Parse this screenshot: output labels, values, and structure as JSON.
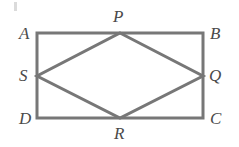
{
  "figure": {
    "stroke_color": "#777777",
    "label_color": "#4a4a4a",
    "background_color": "#ffffff",
    "stroke_width": 3,
    "rectangle": {
      "name": "ABCD",
      "left": 37,
      "top": 33,
      "right": 203,
      "bottom": 118,
      "width": 166,
      "height": 85
    },
    "rhombus": {
      "name": "PQRS",
      "vertices": [
        {
          "label": "P",
          "x": 120,
          "y": 33,
          "on": "AB"
        },
        {
          "label": "Q",
          "x": 203,
          "y": 76,
          "on": "BC"
        },
        {
          "label": "R",
          "x": 120,
          "y": 118,
          "on": "DC"
        },
        {
          "label": "S",
          "x": 37,
          "y": 76,
          "on": "AD"
        }
      ]
    },
    "labels": [
      {
        "name": "label-A",
        "text": "A",
        "x": 19,
        "y": 25
      },
      {
        "name": "label-B",
        "text": "B",
        "x": 210,
        "y": 25
      },
      {
        "name": "label-C",
        "text": "C",
        "x": 210,
        "y": 110
      },
      {
        "name": "label-D",
        "text": "D",
        "x": 19,
        "y": 110
      },
      {
        "name": "label-P",
        "text": "P",
        "x": 113,
        "y": 8
      },
      {
        "name": "label-Q",
        "text": "Q",
        "x": 209,
        "y": 67
      },
      {
        "name": "label-S",
        "text": "S",
        "x": 19,
        "y": 67
      },
      {
        "name": "label-R",
        "text": "R",
        "x": 114,
        "y": 125
      }
    ]
  }
}
